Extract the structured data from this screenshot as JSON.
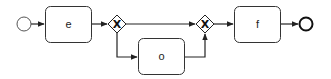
{
  "diagram": {
    "type": "bpmn-process",
    "colors": {
      "stroke": "#222222",
      "fill": "#ffffff"
    },
    "nodes": {
      "start": {
        "kind": "start-event"
      },
      "task_e": {
        "kind": "task",
        "label": "e"
      },
      "gateway_split": {
        "kind": "exclusive-gateway",
        "marker": "X"
      },
      "task_o": {
        "kind": "task",
        "label": "o"
      },
      "gateway_join": {
        "kind": "exclusive-gateway",
        "marker": "X"
      },
      "task_f": {
        "kind": "task",
        "label": "f"
      },
      "end": {
        "kind": "end-event"
      }
    },
    "edges": [
      {
        "from": "start",
        "to": "task_e"
      },
      {
        "from": "task_e",
        "to": "gateway_split"
      },
      {
        "from": "gateway_split",
        "to": "gateway_join"
      },
      {
        "from": "gateway_split",
        "to": "task_o"
      },
      {
        "from": "task_o",
        "to": "gateway_join"
      },
      {
        "from": "gateway_join",
        "to": "task_f"
      },
      {
        "from": "task_f",
        "to": "end"
      }
    ]
  }
}
